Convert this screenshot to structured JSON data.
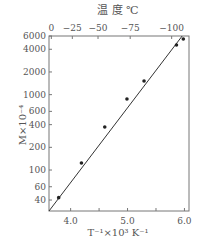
{
  "chart_data": {
    "type": "scatter",
    "title": "温 度 ℃",
    "xlabel": "T⁻¹×10³ K⁻¹",
    "ylabel": "M×10⁻⁴",
    "xlim": [
      3.62,
      6.08
    ],
    "ylim": [
      28.6,
      6000
    ],
    "yscale": "log",
    "grid": false,
    "legend": null,
    "x_ticks": [
      {
        "value": 4.0,
        "label": "4.0"
      },
      {
        "value": 4.5,
        "label": ""
      },
      {
        "value": 5.0,
        "label": "5.0"
      },
      {
        "value": 5.5,
        "label": ""
      },
      {
        "value": 6.0,
        "label": "6.0"
      }
    ],
    "y_ticks": [
      {
        "value": 40,
        "label": "40"
      },
      {
        "value": 60,
        "label": "60"
      },
      {
        "value": 100,
        "label": "100"
      },
      {
        "value": 200,
        "label": "200"
      },
      {
        "value": 400,
        "label": "400"
      },
      {
        "value": 600,
        "label": "600"
      },
      {
        "value": 1000,
        "label": "1000"
      },
      {
        "value": 2000,
        "label": "2000"
      },
      {
        "value": 4000,
        "label": "4000"
      },
      {
        "value": 6000,
        "label": "6000"
      }
    ],
    "top_axis": {
      "label": "温 度 ℃",
      "ticks": [
        {
          "celsius": 0,
          "label": "0"
        },
        {
          "celsius": -25,
          "label": "−25"
        },
        {
          "celsius": -50,
          "label": "−50"
        },
        {
          "celsius": -75,
          "label": "−75"
        },
        {
          "celsius": -100,
          "label": "−100"
        }
      ]
    },
    "series": [
      {
        "name": "data",
        "marker": "filled-circle",
        "points": [
          {
            "x": 3.79,
            "y": 43
          },
          {
            "x": 4.19,
            "y": 124
          },
          {
            "x": 4.6,
            "y": 372
          },
          {
            "x": 4.99,
            "y": 875
          },
          {
            "x": 5.29,
            "y": 1516
          },
          {
            "x": 5.86,
            "y": 4560
          },
          {
            "x": 5.98,
            "y": 5470
          }
        ]
      }
    ],
    "fit_line": {
      "x1": 3.62,
      "y1": 28.6,
      "x2": 5.96,
      "y2": 6000
    }
  },
  "colors": {
    "axis": "#777777",
    "line": "#333333",
    "marker": "#222222",
    "text": "#555555"
  }
}
